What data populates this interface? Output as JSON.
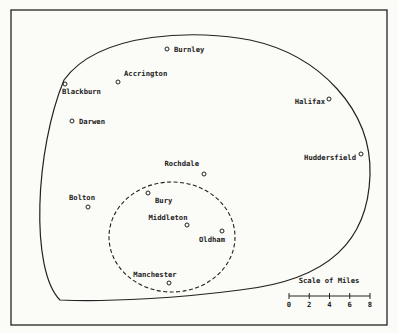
{
  "map": {
    "colors": {
      "ink": "#222222",
      "paper": "#fbfbf8"
    },
    "towns": [
      {
        "name": "Burnley",
        "x": 167,
        "y": 49,
        "lx": 174,
        "ly": 52,
        "anchor": "start"
      },
      {
        "name": "Accrington",
        "x": 118,
        "y": 82,
        "lx": 124,
        "ly": 76,
        "anchor": "start"
      },
      {
        "name": "Blackburn",
        "x": 65,
        "y": 84,
        "lx": 62,
        "ly": 94,
        "anchor": "start"
      },
      {
        "name": "Darwen",
        "x": 72,
        "y": 121,
        "lx": 79,
        "ly": 124,
        "anchor": "start"
      },
      {
        "name": "Halifax",
        "x": 329,
        "y": 99,
        "lx": 325,
        "ly": 104,
        "anchor": "end"
      },
      {
        "name": "Huddersfield",
        "x": 361,
        "y": 154,
        "lx": 356,
        "ly": 160,
        "anchor": "end"
      },
      {
        "name": "Rochdale",
        "x": 204,
        "y": 174,
        "lx": 199,
        "ly": 166,
        "anchor": "end"
      },
      {
        "name": "Bolton",
        "x": 88,
        "y": 207,
        "lx": 82,
        "ly": 200,
        "anchor": "middle"
      },
      {
        "name": "Bury",
        "x": 148,
        "y": 193,
        "lx": 155,
        "ly": 203,
        "anchor": "start"
      },
      {
        "name": "Middleton",
        "x": 187,
        "y": 225,
        "lx": 168,
        "ly": 220,
        "anchor": "middle"
      },
      {
        "name": "Oldham",
        "x": 222,
        "y": 231,
        "lx": 212,
        "ly": 242,
        "anchor": "middle"
      },
      {
        "name": "Manchester",
        "x": 169,
        "y": 283,
        "lx": 155,
        "ly": 277,
        "anchor": "middle"
      }
    ],
    "scale": {
      "title": "Scale of Miles",
      "ticks": [
        "0",
        "2",
        "4",
        "6",
        "8"
      ]
    }
  }
}
